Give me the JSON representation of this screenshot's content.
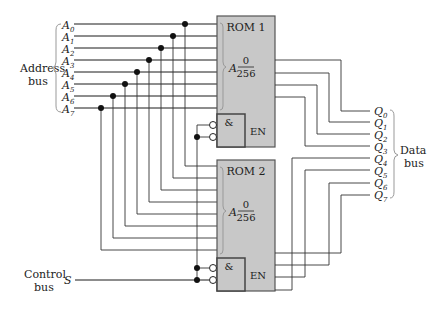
{
  "figure": {
    "address_bus": {
      "label_line1": "Address",
      "label_line2": "bus",
      "lines": [
        {
          "name": "A",
          "sub": "0"
        },
        {
          "name": "A",
          "sub": "1"
        },
        {
          "name": "A",
          "sub": "2"
        },
        {
          "name": "A",
          "sub": "3"
        },
        {
          "name": "A",
          "sub": "4"
        },
        {
          "name": "A",
          "sub": "5"
        },
        {
          "name": "A",
          "sub": "6"
        },
        {
          "name": "A",
          "sub": "7"
        }
      ]
    },
    "data_bus": {
      "label_line1": "Data",
      "label_line2": "bus",
      "lines": [
        {
          "name": "Q",
          "sub": "0"
        },
        {
          "name": "Q",
          "sub": "1"
        },
        {
          "name": "Q",
          "sub": "2"
        },
        {
          "name": "Q",
          "sub": "3"
        },
        {
          "name": "Q",
          "sub": "4"
        },
        {
          "name": "Q",
          "sub": "5"
        },
        {
          "name": "Q",
          "sub": "6"
        },
        {
          "name": "Q",
          "sub": "7"
        }
      ]
    },
    "control_bus": {
      "label_line1": "Control",
      "label_line2": "bus",
      "signal": "S"
    },
    "rom1": {
      "title": "ROM 1",
      "addr_label": "A",
      "range_top": "0",
      "range_bottom": "256",
      "gate_symbol": "&",
      "enable_label": "EN"
    },
    "rom2": {
      "title": "ROM 2",
      "addr_label": "A",
      "range_top": "0",
      "range_bottom": "256",
      "gate_symbol": "&",
      "enable_label": "EN"
    },
    "colors": {
      "rom_fill": "#c8c8c8",
      "wire": "#1a1a1a",
      "background": "#ffffff"
    }
  }
}
